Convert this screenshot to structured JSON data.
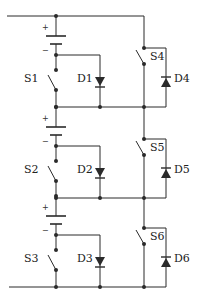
{
  "diagram": {
    "type": "circuit-schematic",
    "colors": {
      "wire": "#2a2a2a",
      "background": "#ffffff"
    },
    "stages": [
      {
        "switch_left": "S1",
        "diode_left": "D1",
        "switch_right": "S4",
        "diode_right": "D4",
        "battery_plus": "+",
        "battery_minus": "−"
      },
      {
        "switch_left": "S2",
        "diode_left": "D2",
        "switch_right": "S5",
        "diode_right": "D5",
        "battery_plus": "+",
        "battery_minus": "−"
      },
      {
        "switch_left": "S3",
        "diode_left": "D3",
        "switch_right": "S6",
        "diode_right": "D6",
        "battery_plus": "+",
        "battery_minus": "−"
      }
    ]
  }
}
